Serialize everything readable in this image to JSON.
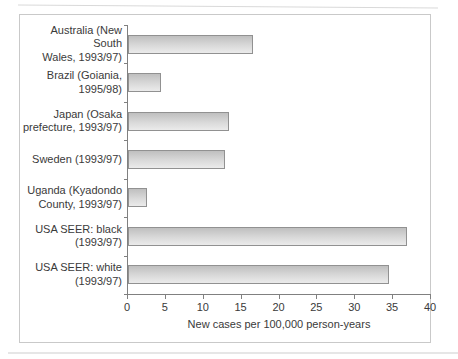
{
  "figure": {
    "background": "#ffffff",
    "frame_border_color": "#c9c9c9"
  },
  "chart_data": {
    "type": "bar",
    "orientation": "horizontal",
    "title": "",
    "xlabel": "New cases per 100,000 person-years",
    "ylabel": "",
    "xlim": [
      0,
      40
    ],
    "xticks": [
      0,
      5,
      10,
      15,
      20,
      25,
      30,
      35,
      40
    ],
    "grid": false,
    "legend": false,
    "axis_color": "#808080",
    "text_color": "#3a3a3a",
    "bar_border_color": "#919191",
    "bar_fill_top": "#bfbfbf",
    "bar_fill_bottom": "#ebebeb",
    "categories": [
      "Australia (New South Wales, 1993/97)",
      "Brazil (Goiania, 1995/98)",
      "Japan (Osaka prefecture, 1993/97)",
      "Sweden (1993/97)",
      "Uganda (Kyadondo County, 1993/97)",
      "USA SEER: black (1993/97)",
      "USA SEER: white (1993/97)"
    ],
    "category_lines": [
      [
        "Australia (New South",
        "Wales, 1993/97)"
      ],
      [
        "Brazil (Goiania,",
        "1995/98)"
      ],
      [
        "Japan (Osaka",
        "prefecture, 1993/97)"
      ],
      [
        "Sweden (1993/97)"
      ],
      [
        "Uganda (Kyadondo",
        "County, 1993/97)"
      ],
      [
        "USA SEER: black",
        "(1993/97)"
      ],
      [
        "USA SEER: white",
        "(1993/97)"
      ]
    ],
    "values": [
      16.5,
      4.3,
      13.3,
      12.8,
      2.5,
      36.8,
      34.5
    ]
  }
}
